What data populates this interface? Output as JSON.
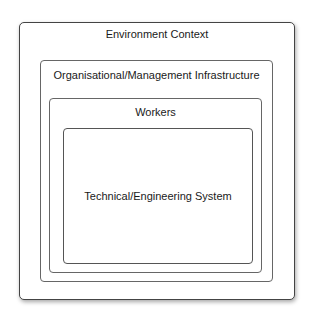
{
  "diagram": {
    "type": "nested-boxes",
    "layers": [
      {
        "id": "environment",
        "label": "Environment Context"
      },
      {
        "id": "organisation",
        "label": "Organisational/Management Infrastructure"
      },
      {
        "id": "workers",
        "label": "Workers"
      },
      {
        "id": "technical",
        "label": "Technical/Engineering System"
      }
    ]
  }
}
